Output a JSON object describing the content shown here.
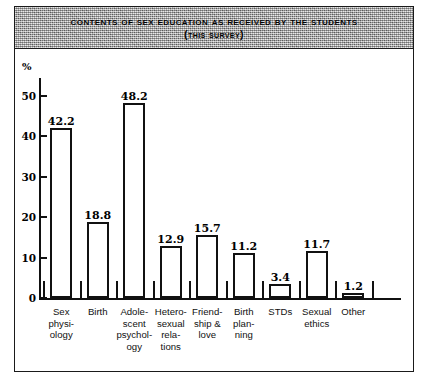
{
  "title": {
    "main": "Contents of Sex Education as Received by the Students",
    "sub": "(This survey)"
  },
  "chart_data": {
    "type": "bar",
    "title": "Contents of Sex Education as Received by the Students (This survey)",
    "xlabel": "",
    "ylabel": "%",
    "ylim": [
      0,
      50
    ],
    "yticks": [
      0,
      10,
      20,
      30,
      40,
      50
    ],
    "grid": false,
    "legend": null,
    "categories": [
      "Sex physiology",
      "Birth",
      "Adolescent psychology",
      "Heterosexual relations",
      "Friendship & love",
      "Birth planning",
      "STDs",
      "Sexual ethics",
      "Other"
    ],
    "category_lines": [
      [
        "Sex",
        "physi-",
        "ology"
      ],
      [
        "Birth"
      ],
      [
        "Adole-",
        "scent",
        "psychol-",
        "ogy"
      ],
      [
        "Hetero-",
        "sexual",
        "rela-",
        "tions"
      ],
      [
        "Friend-",
        "ship &",
        "love"
      ],
      [
        "Birth",
        "plan-",
        "ning"
      ],
      [
        "STDs"
      ],
      [
        "Sexual",
        "ethics"
      ],
      [
        "Other"
      ]
    ],
    "values": [
      42.2,
      18.8,
      48.2,
      12.9,
      15.7,
      11.2,
      3.4,
      11.7,
      1.2
    ],
    "value_labels": [
      "42.2",
      "18.8",
      "48.2",
      "12.9",
      "15.7",
      "11.2",
      "3.4",
      "11.7",
      "1.2"
    ]
  },
  "style": {
    "bar_fill": "#ffffff",
    "bar_stroke": "#111111",
    "axis_color": "#111111",
    "title_band": "#a8a8a8",
    "page_background": "#ffffff"
  }
}
